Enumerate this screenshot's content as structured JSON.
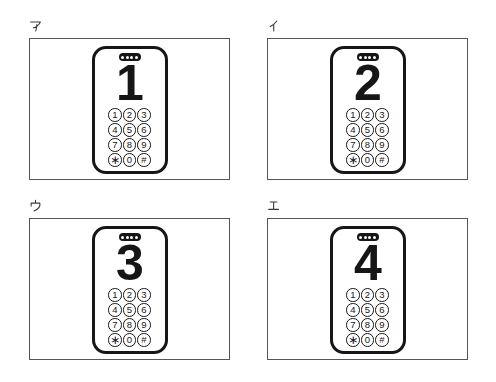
{
  "figure": {
    "panels": [
      {
        "label": "ア",
        "phone": {
          "display_number": "1"
        }
      },
      {
        "label": "イ",
        "phone": {
          "display_number": "2"
        }
      },
      {
        "label": "ウ",
        "phone": {
          "display_number": "3"
        }
      },
      {
        "label": "エ",
        "phone": {
          "display_number": "4"
        }
      }
    ],
    "keypad_rows": [
      [
        "1",
        "2",
        "3"
      ],
      [
        "4",
        "5",
        "6"
      ],
      [
        "7",
        "8",
        "9"
      ],
      [
        "∗",
        "0",
        "#"
      ]
    ],
    "colors": {
      "ink": "#161616",
      "panel_border": "#555555",
      "background": "#ffffff",
      "pill_dots": "#fcfcfc"
    }
  }
}
